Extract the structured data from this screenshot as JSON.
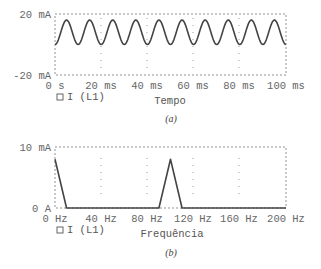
{
  "chart_data": [
    {
      "id": "a",
      "type": "line",
      "caption": "(a)",
      "xlabel": "Tempo",
      "ylabel": "",
      "x_ticks": [
        "0 s",
        "20 ms",
        "40 ms",
        "60 ms",
        "80 ms",
        "100 ms"
      ],
      "y_ticks": [
        "20 mA",
        "-20 mA"
      ],
      "xlim_ms": [
        0,
        100
      ],
      "ylim_mA": [
        -20,
        20
      ],
      "legend": [
        "I (L1)"
      ],
      "grid": "dotted vertical at 40 ms and 80 ms",
      "series": [
        {
          "name": "I (L1)",
          "description": "Periodic current: 8 mA DC offset plus 8 mA amplitude at 100 Hz (10 cycles in 100 ms), min ≈ 0 mA, max ≈ 16 mA",
          "dc_mA": 8,
          "amplitude_mA": 8,
          "frequency_Hz": 100,
          "x_ms": [
            0,
            5,
            10,
            15,
            20,
            25,
            30,
            35,
            40,
            45,
            50,
            55,
            60,
            65,
            70,
            75,
            80,
            85,
            90,
            95,
            100
          ],
          "values_mA": [
            0,
            16,
            0,
            16,
            0,
            16,
            0,
            16,
            0,
            16,
            0,
            16,
            0,
            16,
            0,
            16,
            0,
            16,
            0,
            16,
            0
          ]
        }
      ]
    },
    {
      "id": "b",
      "type": "line",
      "caption": "(b)",
      "xlabel": "Frequência",
      "ylabel": "",
      "x_ticks": [
        "0 Hz",
        "40 Hz",
        "80 Hz",
        "120 Hz",
        "160 Hz",
        "200 Hz"
      ],
      "y_ticks": [
        "10 mA",
        "0 A"
      ],
      "xlim_Hz": [
        0,
        200
      ],
      "ylim_mA": [
        0,
        10
      ],
      "legend": [
        "I (L1)"
      ],
      "grid": "dotted vertical at 40, 80, 120, 160 Hz",
      "series": [
        {
          "name": "I (L1)",
          "x_Hz": [
            0,
            10,
            90,
            100,
            110,
            200
          ],
          "values_mA": [
            8,
            0,
            0,
            8,
            0,
            0
          ]
        }
      ]
    }
  ],
  "plots": {
    "a": {
      "y_top": "20 mA",
      "y_bottom": "-20 mA",
      "x_ticks": [
        "0 s",
        "20 ms",
        "40 ms",
        "60 ms",
        "80 ms",
        "100 ms"
      ],
      "legend": "I (L1)",
      "xlabel": "Tempo",
      "caption": "(a)"
    },
    "b": {
      "y_top": "10 mA",
      "y_bottom": "0 A",
      "x_ticks": [
        "0 Hz",
        "40 Hz",
        "80 Hz",
        "120 Hz",
        "160 Hz",
        "200 Hz"
      ],
      "legend": "I (L1)",
      "xlabel": "Frequência",
      "caption": "(b)"
    }
  },
  "colors": {
    "trace": "#444444",
    "frame": "#777777",
    "text": "#555555"
  }
}
